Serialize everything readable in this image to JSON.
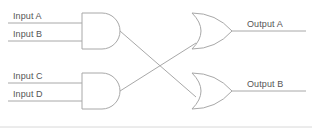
{
  "diagram": {
    "type": "logic-circuit",
    "colors": {
      "background": "#ffffff",
      "line": "#a8a8a8",
      "text": "#555555",
      "frame": "#d8d8d8"
    },
    "inputs": [
      {
        "label": "Input A",
        "x": 13,
        "y": 11,
        "wire_y": 23,
        "wire_x1": 8,
        "wire_x2": 82
      },
      {
        "label": "Input B",
        "x": 13,
        "y": 29,
        "wire_y": 41,
        "wire_x1": 8,
        "wire_x2": 82
      },
      {
        "label": "Input C",
        "x": 13,
        "y": 71,
        "wire_y": 83,
        "wire_x1": 8,
        "wire_x2": 82
      },
      {
        "label": "Input D",
        "x": 13,
        "y": 89,
        "wire_y": 101,
        "wire_x1": 8,
        "wire_x2": 82
      }
    ],
    "outputs": [
      {
        "label": "Output A",
        "x": 247,
        "y": 19,
        "wire_y": 31,
        "wire_x1": 232,
        "wire_x2": 306
      },
      {
        "label": "Output B",
        "x": 247,
        "y": 79,
        "wire_y": 91,
        "wire_x1": 232,
        "wire_x2": 306
      }
    ],
    "gates": [
      {
        "name": "and-gate-top",
        "kind": "AND",
        "x": 82,
        "y": 13,
        "width": 38,
        "height": 36
      },
      {
        "name": "and-gate-bottom",
        "kind": "AND",
        "x": 82,
        "y": 73,
        "width": 38,
        "height": 36
      },
      {
        "name": "or-gate-top",
        "kind": "OR",
        "x": 192,
        "y": 13,
        "width": 40,
        "height": 36
      },
      {
        "name": "or-gate-bottom",
        "kind": "OR",
        "x": 192,
        "y": 73,
        "width": 40,
        "height": 36
      }
    ],
    "connections": [
      {
        "name": "and-top-to-or-bottom",
        "from": "and-gate-top",
        "to": "or-gate-bottom",
        "x1": 120,
        "y1": 31,
        "x2": 196,
        "y2": 97
      },
      {
        "name": "and-bottom-to-or-top",
        "from": "and-gate-bottom",
        "to": "or-gate-top",
        "x1": 120,
        "y1": 91,
        "x2": 196,
        "y2": 43
      }
    ],
    "frame": {
      "bottom_y": 127,
      "x1": 0,
      "x2": 312
    }
  }
}
